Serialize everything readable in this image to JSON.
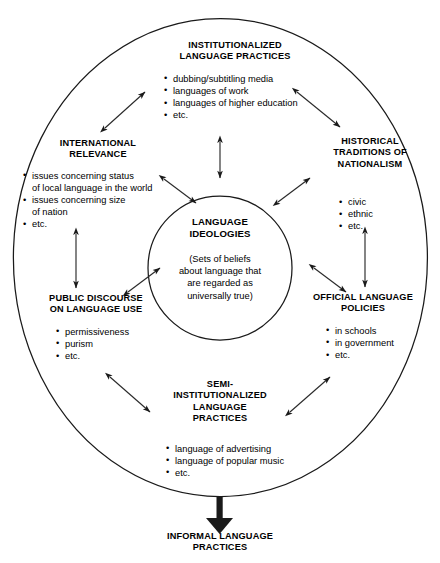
{
  "diagram": {
    "shapes": {
      "outer_ellipse": "ellipse",
      "inner_circle": "circle",
      "terminal_arrow": "thick-down-arrow"
    },
    "colors": {
      "stroke": "#1a1a1a",
      "text": "#000000",
      "background": "#ffffff"
    },
    "center": {
      "title": "LANGUAGE\nIDEOLOGIES",
      "description": "(Sets of beliefs\nabout language that\nare regarded as\nuniversally true)"
    },
    "nodes": [
      {
        "id": "institutionalized",
        "title": "INSTITUTIONALIZED\nLANGUAGE PRACTICES",
        "bullets": [
          "dubbing/subtitling media",
          "languages of work",
          "languages of higher education",
          "etc."
        ]
      },
      {
        "id": "international",
        "title": "INTERNATIONAL\nRELEVANCE",
        "bullets": [
          "issues concerning status\nof local language in the world",
          "issues concerning size\nof nation",
          "etc."
        ]
      },
      {
        "id": "historical",
        "title": "HISTORICAL\nTRADITIONS OF\nNATIONALISM",
        "bullets": [
          "civic",
          "ethnic",
          "etc."
        ]
      },
      {
        "id": "public",
        "title": "PUBLIC DISCOURSE\nON LANGUAGE USE",
        "bullets": [
          "permissiveness",
          "purism",
          "etc."
        ]
      },
      {
        "id": "official",
        "title": "OFFICIAL LANGUAGE\nPOLICIES",
        "bullets": [
          "in schools",
          "in government",
          "etc."
        ]
      },
      {
        "id": "semi",
        "title": "SEMI-\nINSTITUTIONALIZED\nLANGUAGE\nPRACTICES",
        "bullets": [
          "language of advertising",
          "language of popular music",
          "etc."
        ]
      }
    ],
    "outcome": {
      "title": "INFORMAL LANGUAGE\nPRACTICES"
    },
    "connectors": [
      {
        "id": "international-institutionalized",
        "style": "double-headed-diagonal"
      },
      {
        "id": "institutionalized-historical",
        "style": "double-headed-diagonal"
      },
      {
        "id": "institutionalized-center",
        "style": "double-headed-vertical"
      },
      {
        "id": "international-center",
        "style": "double-headed-diagonal"
      },
      {
        "id": "historical-center",
        "style": "double-headed-diagonal"
      },
      {
        "id": "international-public",
        "style": "double-headed-vertical"
      },
      {
        "id": "historical-official",
        "style": "double-headed-vertical"
      },
      {
        "id": "public-center",
        "style": "double-headed-diagonal"
      },
      {
        "id": "official-center",
        "style": "double-headed-diagonal"
      },
      {
        "id": "public-semi",
        "style": "double-headed-diagonal"
      },
      {
        "id": "semi-official",
        "style": "double-headed-diagonal"
      },
      {
        "id": "semi-informal",
        "style": "thick-single-arrow-down"
      }
    ]
  }
}
